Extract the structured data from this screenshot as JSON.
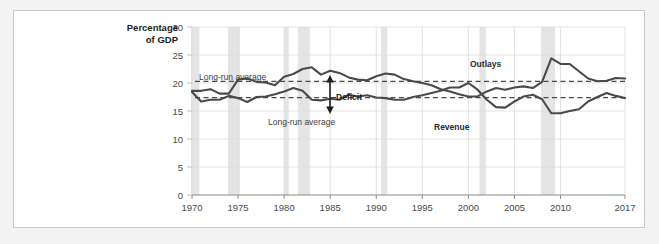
{
  "figure": {
    "panel_background": "#ffffff",
    "page_background": "#f3f3f3",
    "border_color": "#c9c9c9"
  },
  "axis_title": {
    "line1": "Percentage",
    "line2": "of GDP"
  },
  "annotations": {
    "outlays_long_run_average": "Long-run average",
    "revenue_long_run_average": "Long-run average",
    "deficit": "Deficit",
    "outlays": "Outlays",
    "revenue": "Revenue"
  },
  "chart_data": {
    "type": "line",
    "title": "",
    "subtitle": "",
    "xlabel": "",
    "ylabel": "Percentage of GDP",
    "xlim": [
      1970,
      2017
    ],
    "ylim": [
      0,
      30
    ],
    "grid": true,
    "legend_position": "inline-labels",
    "yticks": [
      0,
      5,
      10,
      15,
      20,
      25,
      30
    ],
    "ytick_labels": [
      "0",
      "5",
      "10",
      "15",
      "20",
      "25",
      "30"
    ],
    "xticks": [
      1970,
      1975,
      1980,
      1985,
      1990,
      1995,
      2000,
      2005,
      2010,
      2017
    ],
    "xtick_labels": [
      "1970",
      "1975",
      "1980",
      "1985",
      "1990",
      "1995",
      "2000",
      "2005",
      "2010",
      "2017"
    ],
    "x": [
      1970,
      1971,
      1972,
      1973,
      1974,
      1975,
      1976,
      1977,
      1978,
      1979,
      1980,
      1981,
      1982,
      1983,
      1984,
      1985,
      1986,
      1987,
      1988,
      1989,
      1990,
      1991,
      1992,
      1993,
      1994,
      1995,
      1996,
      1997,
      1998,
      1999,
      2000,
      2001,
      2002,
      2003,
      2004,
      2005,
      2006,
      2007,
      2008,
      2009,
      2010,
      2011,
      2012,
      2013,
      2014,
      2015,
      2016,
      2017
    ],
    "series": [
      {
        "name": "Outlays",
        "color": "#4a4a4a",
        "values": [
          18.6,
          18.6,
          18.9,
          18.1,
          18.1,
          20.6,
          20.8,
          20.2,
          20.1,
          19.6,
          21.1,
          21.6,
          22.5,
          22.8,
          21.5,
          22.2,
          21.8,
          21.0,
          20.6,
          20.5,
          21.2,
          21.7,
          21.5,
          20.7,
          20.3,
          20.0,
          19.6,
          18.9,
          18.5,
          18.0,
          17.6,
          17.6,
          18.5,
          19.1,
          18.8,
          19.2,
          19.4,
          19.1,
          20.2,
          24.4,
          23.4,
          23.4,
          22.1,
          20.8,
          20.3,
          20.4,
          20.9,
          20.8
        ],
        "style": "solid"
      },
      {
        "name": "Revenue",
        "color": "#4a4a4a",
        "values": [
          18.4,
          16.7,
          17.0,
          17.0,
          17.7,
          17.3,
          16.6,
          17.5,
          17.6,
          18.0,
          18.5,
          19.1,
          18.6,
          17.0,
          16.9,
          17.2,
          17.0,
          17.9,
          17.6,
          17.8,
          17.4,
          17.3,
          17.0,
          17.0,
          17.5,
          17.8,
          18.2,
          18.6,
          19.2,
          19.2,
          20.0,
          18.8,
          17.0,
          15.7,
          15.6,
          16.7,
          17.6,
          17.9,
          17.1,
          14.6,
          14.6,
          15.0,
          15.3,
          16.7,
          17.5,
          18.2,
          17.7,
          17.3
        ],
        "style": "solid"
      }
    ],
    "reference_lines": [
      {
        "name": "Outlays long-run average",
        "value": 20.3,
        "style": "dashed",
        "color": "#4a4a4a",
        "label": "Long-run average"
      },
      {
        "name": "Revenue long-run average",
        "value": 17.4,
        "style": "dashed",
        "color": "#4a4a4a",
        "label": "Long-run average"
      }
    ],
    "shaded_bands": [
      {
        "name": "recession-1970",
        "start": 1969.9,
        "end": 1970.8
      },
      {
        "name": "recession-1974",
        "start": 1973.9,
        "end": 1975.2
      },
      {
        "name": "recession-1980",
        "start": 1980.0,
        "end": 1980.5
      },
      {
        "name": "recession-1981",
        "start": 1981.5,
        "end": 1982.8
      },
      {
        "name": "recession-1990",
        "start": 1990.5,
        "end": 1991.2
      },
      {
        "name": "recession-2001",
        "start": 2001.2,
        "end": 2001.9
      },
      {
        "name": "recession-2008",
        "start": 2007.9,
        "end": 2009.4
      }
    ],
    "band_color": "#e4e4e4",
    "grid_color": "#dcdcdc"
  }
}
